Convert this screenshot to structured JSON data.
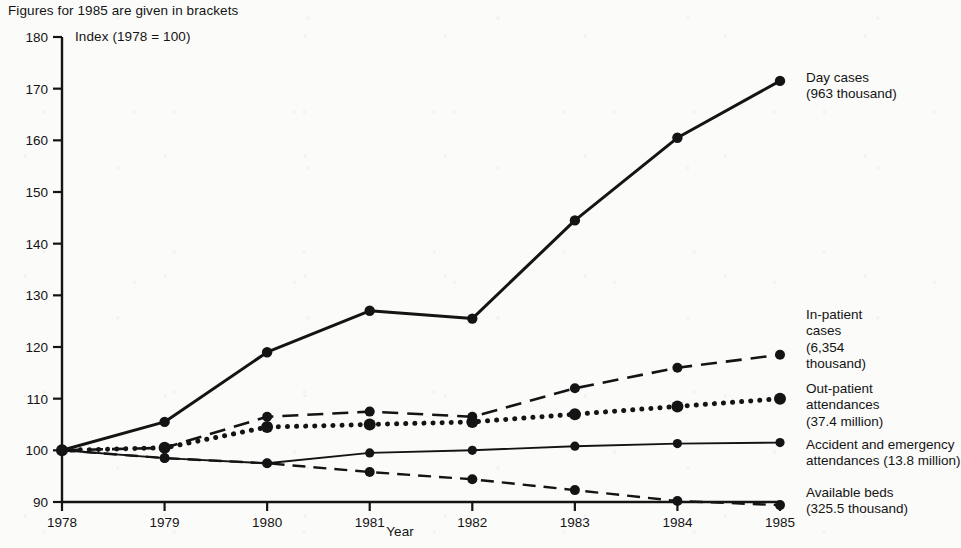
{
  "caption": {
    "top_note": "Figures for 1985 are given in brackets",
    "index_note": "Index (1978 = 100)"
  },
  "chart_data": {
    "type": "line",
    "title": "",
    "subtitle": "Figures for 1985 are given in brackets",
    "annotation": "Index (1978 = 100)",
    "xlabel": "Year",
    "ylabel": "",
    "x": [
      1978,
      1979,
      1980,
      1981,
      1982,
      1983,
      1984,
      1985
    ],
    "categories": [
      "1978",
      "1979",
      "1980",
      "1981",
      "1982",
      "1983",
      "1984",
      "1985"
    ],
    "xlim": [
      1978,
      1985
    ],
    "ylim": [
      90,
      180
    ],
    "yticks": [
      90,
      100,
      110,
      120,
      130,
      140,
      150,
      160,
      170,
      180
    ],
    "ytick_labels": [
      "90",
      "100",
      "110",
      "120",
      "130",
      "140",
      "150",
      "160",
      "170",
      "180"
    ],
    "grid": false,
    "legend_position": "right-inline",
    "series": [
      {
        "name": "Day cases",
        "value_1985": "963 thousand",
        "label_lines": [
          "Day cases",
          "(963 thousand)"
        ],
        "style": "solid-thick",
        "markers": true,
        "values": [
          100,
          105.5,
          119,
          127,
          125.5,
          144.5,
          160.5,
          171.5
        ]
      },
      {
        "name": "In-patient cases",
        "value_1985": "6,354 thousand",
        "label_lines": [
          "In-patient",
          "cases",
          "(6,354",
          "thousand)"
        ],
        "style": "long-dashed",
        "markers": true,
        "values": [
          100,
          100.5,
          106.5,
          107.5,
          106.5,
          112,
          116,
          118.5
        ]
      },
      {
        "name": "Out-patient attendances",
        "value_1985": "37.4 million",
        "label_lines": [
          "Out-patient",
          "attendances",
          "(37.4 million)"
        ],
        "style": "dotted",
        "markers": true,
        "values": [
          100,
          100.5,
          104.5,
          105,
          105.5,
          107,
          108.5,
          110
        ]
      },
      {
        "name": "Accident and emergency attendances",
        "value_1985": "13.8 million",
        "label_lines": [
          "Accident and emergency",
          "attendances (13.8 million)"
        ],
        "style": "solid-thin",
        "markers": true,
        "values": [
          100,
          98.5,
          97.5,
          99.5,
          100,
          100.8,
          101.3,
          101.5
        ]
      },
      {
        "name": "Available beds",
        "value_1985": "325.5 thousand",
        "label_lines": [
          "Available beds",
          "(325.5 thousand)"
        ],
        "style": "dashed",
        "markers": true,
        "values": [
          100,
          98.5,
          97.5,
          95.8,
          94.4,
          92.3,
          90.2,
          89.4
        ]
      }
    ]
  },
  "labels": {
    "day_cases": "Day cases\n(963 thousand)",
    "in_patient": "In-patient\ncases\n(6,354\nthousand)",
    "out_patient": "Out-patient\nattendances\n(37.4 million)",
    "accident_emergency": "Accident and emergency\nattendances (13.8 million)",
    "available_beds": "Available beds\n(325.5 thousand)"
  },
  "axis": {
    "x_title": "Year"
  },
  "colors": {
    "ink": "#141414",
    "background": "#fbfbfa"
  }
}
